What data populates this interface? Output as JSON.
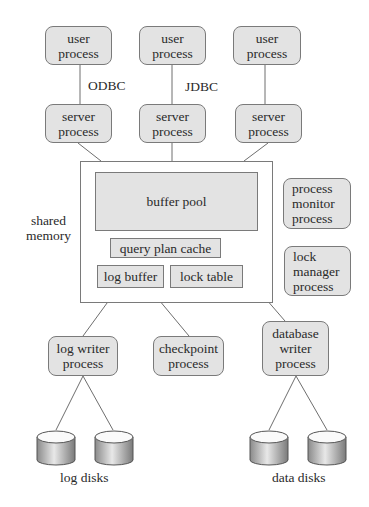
{
  "diagram": {
    "user_processes": [
      {
        "label": "user\nprocess"
      },
      {
        "label": "user\nprocess"
      },
      {
        "label": "user\nprocess"
      }
    ],
    "connection_labels": {
      "odbc": "ODBC",
      "jdbc": "JDBC"
    },
    "server_processes": [
      {
        "label": "server\nprocess"
      },
      {
        "label": "server\nprocess"
      },
      {
        "label": "server\nprocess"
      }
    ],
    "shared_memory": {
      "label": "shared\nmemory",
      "buffer_pool": "buffer pool",
      "query_plan_cache": "query plan cache",
      "log_buffer": "log buffer",
      "lock_table": "lock table"
    },
    "side_processes": {
      "process_monitor": "process\nmonitor\nprocess",
      "lock_manager": "lock\nmanager\nprocess"
    },
    "background_processes": {
      "log_writer": "log writer\nprocess",
      "checkpoint": "checkpoint\nprocess",
      "database_writer": "database\nwriter\nprocess"
    },
    "disk_labels": {
      "log": "log disks",
      "data": "data disks"
    },
    "colors": {
      "box_fill": "#e3e3e3",
      "border": "#7a7a7a"
    }
  }
}
